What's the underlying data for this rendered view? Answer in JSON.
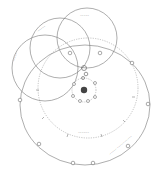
{
  "diagram": {
    "type": "orbital-diagram",
    "colors": {
      "background": "#ffffff",
      "line": "#777777",
      "dashed": "#888888",
      "body": "#444444"
    },
    "circles": [
      {
        "id": "upper-right-circle",
        "cx": 87,
        "cy": 38,
        "r": 30,
        "label": "~~~~~"
      },
      {
        "id": "upper-middle-circle",
        "cx": 60,
        "cy": 48,
        "r": 30,
        "label": "~~~~~"
      },
      {
        "id": "left-circle",
        "cx": 45,
        "cy": 68,
        "r": 33,
        "label": "~~~~~"
      }
    ],
    "dashed_orbit": {
      "cx": 88,
      "cy": 88,
      "r": 50,
      "label": "~~~~~~"
    },
    "outer_orbit": {
      "cx": 85,
      "cy": 105,
      "rx": 65,
      "ry": 60,
      "label": "~~~~~ ~~~~~ ~~~~~"
    },
    "inner_ring": {
      "cx": 84,
      "cy": 90,
      "r": 12
    },
    "central_body": {
      "cx": 84,
      "cy": 90,
      "r": 3.2
    }
  }
}
